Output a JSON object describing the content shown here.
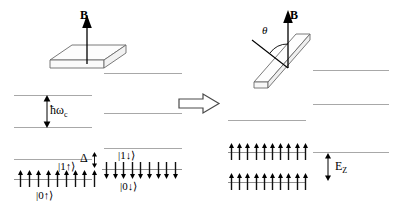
{
  "figure": {
    "type": "energy-level-diagram",
    "background_color": "#ffffff",
    "line_color": "#a8a8a8",
    "ink_color": "#000000"
  },
  "transition_arrow": {
    "glyph": "double-right-arrow",
    "style": "hollow-outline"
  },
  "left_panel": {
    "sample": {
      "shape": "flat-slab-perpendicular",
      "field_label": "B",
      "field_direction": "vertical-up",
      "normal_tilt_deg": 0
    },
    "measures": [
      {
        "name": "cyclotron-gap",
        "label": "ħω",
        "sub": "c"
      },
      {
        "name": "zeeman-gap",
        "label": "Δ",
        "sub": ""
      }
    ],
    "columns": [
      {
        "name": "spin-up-ladder",
        "levels": [
          {
            "name": "empty-level-upper",
            "ket": "",
            "filled": false,
            "spins": 0,
            "spin_dir": ""
          },
          {
            "name": "empty-level-lower",
            "ket": "",
            "filled": false,
            "spins": 0,
            "spin_dir": ""
          },
          {
            "name": "level-1-up",
            "ket": "|1↑⟩",
            "filled": false,
            "spins": 0,
            "spin_dir": "up"
          },
          {
            "name": "level-0-up",
            "ket": "|0↑⟩",
            "filled": true,
            "spins": 9,
            "spin_dir": "up"
          }
        ]
      },
      {
        "name": "spin-down-ladder",
        "levels": [
          {
            "name": "empty-level-upper",
            "ket": "",
            "filled": false,
            "spins": 0,
            "spin_dir": ""
          },
          {
            "name": "empty-level-lower",
            "ket": "",
            "filled": false,
            "spins": 0,
            "spin_dir": ""
          },
          {
            "name": "level-1-down",
            "ket": "|1↓⟩",
            "filled": false,
            "spins": 0,
            "spin_dir": "down"
          },
          {
            "name": "level-0-down",
            "ket": "|0↓⟩",
            "filled": true,
            "spins": 9,
            "spin_dir": "down"
          }
        ]
      }
    ]
  },
  "right_panel": {
    "sample": {
      "shape": "tilted-slab",
      "field_label": "B",
      "field_direction": "vertical-up",
      "angle_label": "θ",
      "angle_between": "surface-normal-and-field"
    },
    "measures": [
      {
        "name": "zeeman-energy",
        "label": "E",
        "sub": "Z"
      }
    ],
    "columns": [
      {
        "name": "filled-ladder",
        "levels": [
          {
            "name": "empty-level-top",
            "ket": "",
            "filled": false,
            "spins": 0,
            "spin_dir": ""
          },
          {
            "name": "filled-level-upper",
            "ket": "",
            "filled": true,
            "spins": 10,
            "spin_dir": "up"
          },
          {
            "name": "filled-level-lower",
            "ket": "",
            "filled": true,
            "spins": 10,
            "spin_dir": "up"
          }
        ]
      },
      {
        "name": "empty-ladder",
        "levels": [
          {
            "name": "empty-level-1",
            "ket": "",
            "filled": false,
            "spins": 0,
            "spin_dir": ""
          },
          {
            "name": "empty-level-2",
            "ket": "",
            "filled": false,
            "spins": 0,
            "spin_dir": ""
          },
          {
            "name": "empty-level-3",
            "ket": "",
            "filled": false,
            "spins": 0,
            "spin_dir": ""
          }
        ]
      }
    ]
  }
}
